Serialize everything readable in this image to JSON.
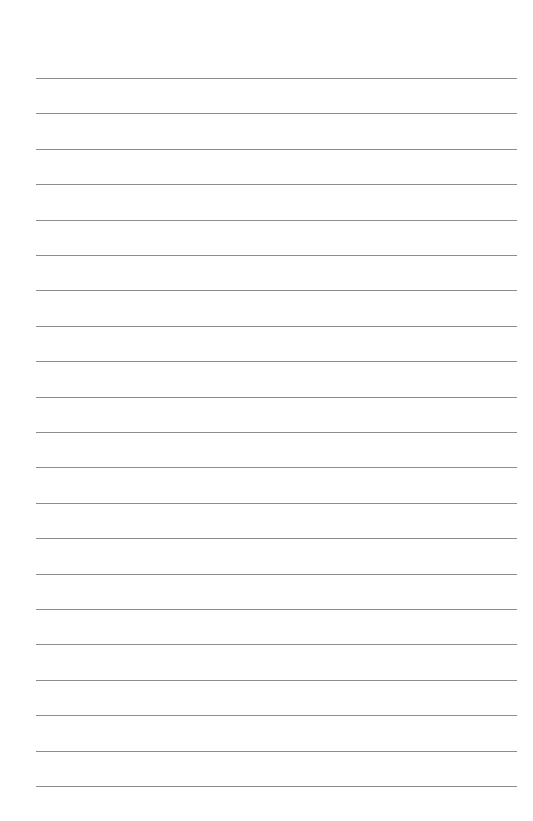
{
  "page": {
    "type": "lined-paper",
    "background_color": "#ffffff",
    "rule_color": "#8c8c8c",
    "rule_count": 21,
    "first_rule_y": 78,
    "rule_spacing": 35.4,
    "rule_left": 36,
    "rule_right": 517
  }
}
